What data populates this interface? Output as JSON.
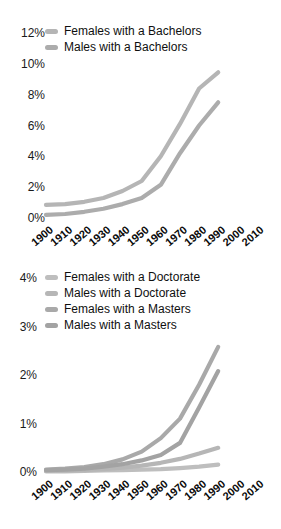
{
  "canvas": {
    "background": "#ffffff",
    "tick_text_color": "#1a1a1a",
    "line_gray_base": "#b0b0b0"
  },
  "chart_data": [
    {
      "type": "line",
      "title": "",
      "xlabel": "",
      "ylabel": "",
      "grid": false,
      "legend_position": "top-left",
      "xlim": [
        1900,
        2010
      ],
      "ylim": [
        0,
        12
      ],
      "x": [
        1900,
        1910,
        1920,
        1930,
        1940,
        1950,
        1960,
        1970,
        1980,
        1990
      ],
      "x_ticks": [
        {
          "label": "1900",
          "value": 1900
        },
        {
          "label": "1910",
          "value": 1910
        },
        {
          "label": "1920",
          "value": 1920
        },
        {
          "label": "1930",
          "value": 1930
        },
        {
          "label": "1940",
          "value": 1940
        },
        {
          "label": "1950",
          "value": 1950
        },
        {
          "label": "1960",
          "value": 1960
        },
        {
          "label": "1970",
          "value": 1970
        },
        {
          "label": "1980",
          "value": 1980
        },
        {
          "label": "1990",
          "value": 1990
        },
        {
          "label": "2000",
          "value": 2000
        },
        {
          "label": "2010",
          "value": 2010
        }
      ],
      "y_ticks": [
        {
          "label": "0%",
          "value": 0
        },
        {
          "label": "2%",
          "value": 2
        },
        {
          "label": "4%",
          "value": 4
        },
        {
          "label": "6%",
          "value": 6
        },
        {
          "label": "8%",
          "value": 8
        },
        {
          "label": "10%",
          "value": 10
        },
        {
          "label": "12%",
          "value": 12
        }
      ],
      "series": [
        {
          "name": "Females with a Bachelors",
          "color": "#b5b5b5",
          "values": [
            0.85,
            0.9,
            1.05,
            1.3,
            1.75,
            2.4,
            4.0,
            6.1,
            8.4,
            9.45
          ]
        },
        {
          "name": "Males with a Bachelors",
          "color": "#acacac",
          "values": [
            0.2,
            0.26,
            0.4,
            0.6,
            0.9,
            1.3,
            2.15,
            4.2,
            6.0,
            7.5
          ]
        }
      ]
    },
    {
      "type": "line",
      "title": "",
      "xlabel": "",
      "ylabel": "",
      "grid": false,
      "legend_position": "top-left",
      "xlim": [
        1900,
        2010
      ],
      "ylim": [
        0,
        4
      ],
      "x": [
        1900,
        1910,
        1920,
        1930,
        1940,
        1950,
        1960,
        1970,
        1980,
        1990
      ],
      "x_ticks": [
        {
          "label": "1900",
          "value": 1900
        },
        {
          "label": "1910",
          "value": 1910
        },
        {
          "label": "1920",
          "value": 1920
        },
        {
          "label": "1930",
          "value": 1930
        },
        {
          "label": "1940",
          "value": 1940
        },
        {
          "label": "1950",
          "value": 1950
        },
        {
          "label": "1960",
          "value": 1960
        },
        {
          "label": "1970",
          "value": 1970
        },
        {
          "label": "1980",
          "value": 1980
        },
        {
          "label": "1990",
          "value": 1990
        },
        {
          "label": "2000",
          "value": 2000
        },
        {
          "label": "2010",
          "value": 2010
        }
      ],
      "y_ticks": [
        {
          "label": "0%",
          "value": 0
        },
        {
          "label": "1%",
          "value": 1
        },
        {
          "label": "2%",
          "value": 2
        },
        {
          "label": "3%",
          "value": 3
        },
        {
          "label": "4%",
          "value": 4
        }
      ],
      "series": [
        {
          "name": "Females with a Doctorate",
          "color": "#bebebe",
          "values": [
            0.01,
            0.015,
            0.02,
            0.03,
            0.04,
            0.05,
            0.06,
            0.08,
            0.11,
            0.15
          ]
        },
        {
          "name": "Males with a Doctorate",
          "color": "#b6b6b6",
          "values": [
            0.02,
            0.03,
            0.04,
            0.06,
            0.09,
            0.13,
            0.19,
            0.27,
            0.38,
            0.5
          ]
        },
        {
          "name": "Females with a Masters",
          "color": "#a9a9a9",
          "values": [
            0.05,
            0.07,
            0.1,
            0.16,
            0.26,
            0.42,
            0.7,
            1.1,
            1.8,
            2.58
          ]
        },
        {
          "name": "Males with a Masters",
          "color": "#a3a3a3",
          "values": [
            0.04,
            0.05,
            0.07,
            0.11,
            0.16,
            0.24,
            0.35,
            0.6,
            1.33,
            2.08
          ]
        }
      ]
    }
  ]
}
